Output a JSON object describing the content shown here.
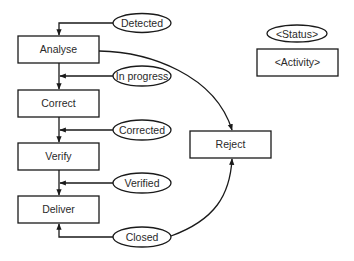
{
  "diagram": {
    "type": "state-activity flow",
    "colors": {
      "stroke": "#1a1a1a",
      "text": "#2a2a2a",
      "background": "#ffffff"
    },
    "legend": {
      "status_label": "<Status>",
      "activity_label": "<Activity>"
    },
    "activities": [
      {
        "id": "analyse",
        "label": "Analyse",
        "x": 18,
        "y": 36,
        "w": 81,
        "h": 27
      },
      {
        "id": "correct",
        "label": "Correct",
        "x": 18,
        "y": 90,
        "w": 81,
        "h": 27
      },
      {
        "id": "verify",
        "label": "Verify",
        "x": 18,
        "y": 143,
        "w": 81,
        "h": 27
      },
      {
        "id": "deliver",
        "label": "Deliver",
        "x": 18,
        "y": 196,
        "w": 81,
        "h": 27
      },
      {
        "id": "reject",
        "label": "Reject",
        "x": 190,
        "y": 131,
        "w": 81,
        "h": 27
      }
    ],
    "statuses": [
      {
        "id": "detected",
        "label": "Detected",
        "cx": 142,
        "cy": 23,
        "rx": 29,
        "ry": 9.5
      },
      {
        "id": "in_progress",
        "label": "In progress",
        "cx": 142,
        "cy": 76,
        "rx": 29,
        "ry": 10
      },
      {
        "id": "corrected",
        "label": "Corrected",
        "cx": 142,
        "cy": 130,
        "rx": 29,
        "ry": 10
      },
      {
        "id": "verified",
        "label": "Verified",
        "cx": 142,
        "cy": 183,
        "rx": 29,
        "ry": 10
      },
      {
        "id": "closed",
        "label": "Closed",
        "cx": 142,
        "cy": 237,
        "rx": 29,
        "ry": 10
      }
    ],
    "edges": [
      {
        "from": "detected",
        "to": "analyse"
      },
      {
        "from": "analyse",
        "to": "correct"
      },
      {
        "from": "in_progress",
        "to": "analyse-correct-link"
      },
      {
        "from": "correct",
        "to": "verify"
      },
      {
        "from": "corrected",
        "to": "correct-verify-link"
      },
      {
        "from": "verify",
        "to": "deliver"
      },
      {
        "from": "verified",
        "to": "verify-deliver-link"
      },
      {
        "from": "closed",
        "to": "deliver"
      },
      {
        "from": "analyse",
        "to": "reject"
      },
      {
        "from": "closed",
        "to": "reject"
      }
    ]
  }
}
